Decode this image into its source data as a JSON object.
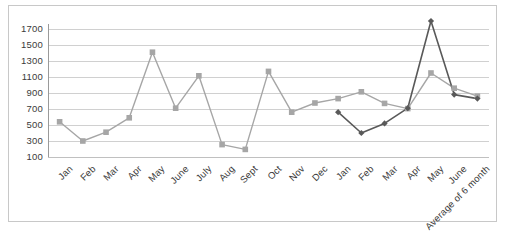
{
  "chart_data": {
    "type": "line",
    "title": "",
    "xlabel": "",
    "ylabel": "",
    "ylim": [
      100,
      1800
    ],
    "yticks": [
      100,
      300,
      500,
      700,
      900,
      1100,
      1300,
      1500,
      1700
    ],
    "grid": true,
    "legend": "none",
    "categories": [
      "Jan",
      "Feb",
      "Mar",
      "Apr",
      "May",
      "June",
      "July",
      "Aug",
      "Sept",
      "Oct",
      "Nov",
      "Dec",
      "Jan",
      "Feb",
      "Mar",
      "Apr",
      "May",
      "June",
      "Average of 6 month"
    ],
    "series": [
      {
        "name": "series-1",
        "color": "#a6a6a6",
        "marker": "square",
        "values": [
          540,
          300,
          410,
          590,
          1410,
          710,
          1115,
          255,
          195,
          1170,
          660,
          775,
          830,
          915,
          770,
          705,
          1150,
          960,
          860
        ]
      },
      {
        "name": "series-2",
        "color": "#595959",
        "marker": "diamond",
        "values": [
          null,
          null,
          null,
          null,
          null,
          null,
          null,
          null,
          null,
          null,
          null,
          null,
          660,
          400,
          520,
          710,
          1800,
          880,
          830
        ]
      }
    ]
  },
  "axis": {
    "y_tick_labels": [
      "1700",
      "1500",
      "1300",
      "1100",
      "900",
      "700",
      "500",
      "300",
      "100"
    ]
  }
}
